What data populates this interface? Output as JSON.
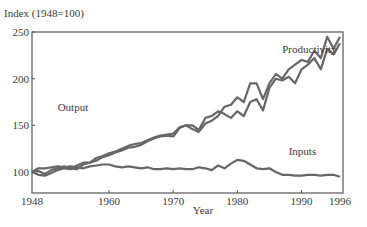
{
  "chart_data": {
    "type": "line",
    "title": "",
    "ylabel": "Index (1948=100)",
    "xlabel": "Year",
    "xlim": [
      1948,
      1996
    ],
    "ylim": [
      78,
      250
    ],
    "yticks": [
      100,
      150,
      200,
      250
    ],
    "xticks": [
      1948,
      1960,
      1970,
      1980,
      1990,
      1996
    ],
    "grid": false,
    "legend": "inline labels",
    "x": [
      1948,
      1949,
      1950,
      1951,
      1952,
      1953,
      1954,
      1955,
      1956,
      1957,
      1958,
      1959,
      1960,
      1961,
      1962,
      1963,
      1964,
      1965,
      1966,
      1967,
      1968,
      1969,
      1970,
      1971,
      1972,
      1973,
      1974,
      1975,
      1976,
      1977,
      1978,
      1979,
      1980,
      1981,
      1982,
      1983,
      1984,
      1985,
      1986,
      1987,
      1988,
      1989,
      1990,
      1991,
      1992,
      1993,
      1994,
      1995,
      1996
    ],
    "series": [
      {
        "name": "Productivity",
        "values": [
          100,
          97,
          96,
          99,
          102,
          104,
          103,
          107,
          110,
          110,
          115,
          117,
          120,
          122,
          125,
          128,
          130,
          131,
          134,
          137,
          139,
          140,
          141,
          148,
          150,
          146,
          143,
          152,
          155,
          160,
          170,
          172,
          180,
          175,
          195,
          195,
          178,
          195,
          205,
          200,
          210,
          215,
          220,
          218,
          230,
          222,
          245,
          232,
          245
        ]
      },
      {
        "name": "Output",
        "values": [
          100,
          101,
          98,
          102,
          104,
          106,
          104,
          103,
          108,
          110,
          112,
          116,
          118,
          121,
          123,
          126,
          127,
          129,
          133,
          136,
          138,
          139,
          138,
          147,
          150,
          150,
          145,
          158,
          160,
          165,
          162,
          158,
          165,
          160,
          175,
          178,
          166,
          190,
          200,
          198,
          202,
          195,
          210,
          215,
          222,
          210,
          232,
          226,
          238
        ]
      },
      {
        "name": "Inputs",
        "values": [
          100,
          104,
          104,
          105,
          106,
          105,
          106,
          105,
          104,
          106,
          107,
          108,
          108,
          106,
          105,
          106,
          105,
          104,
          105,
          103,
          103,
          104,
          103,
          104,
          103,
          103,
          105,
          104,
          102,
          107,
          104,
          109,
          113,
          112,
          108,
          104,
          103,
          104,
          100,
          97,
          97,
          96,
          96,
          97,
          97,
          96,
          97,
          97,
          95
        ]
      }
    ],
    "annotations": [
      {
        "text": "Productivity",
        "x": 1987,
        "y": 228
      },
      {
        "text": "Output",
        "x": 1952,
        "y": 165
      },
      {
        "text": "Inputs",
        "x": 1988,
        "y": 118
      }
    ],
    "colors": {
      "line": "#666666",
      "axis": "#555555",
      "text": "#3a3a3a"
    }
  }
}
